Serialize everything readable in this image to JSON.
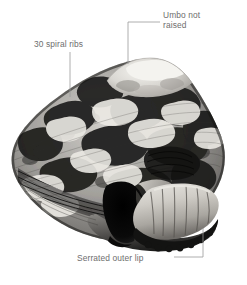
{
  "figure": {
    "background_color": "#ffffff",
    "label_color": "#6e6e6e",
    "leader_color": "#9a9a9a",
    "width": 247,
    "height": 285
  },
  "annotations": {
    "spiral_ribs": {
      "text": "30 spiral ribs",
      "leader": "vertical line down to shell flank"
    },
    "umbo": {
      "text": "Umbo not\nraised",
      "line1": "Umbo not",
      "line2": "raised",
      "leader": "elbow line left then down to shell apex"
    },
    "outer_lip": {
      "text": "Serrated outer lip",
      "leader": "elbow line right then up to shell lip"
    }
  },
  "image": {
    "alt": "Black and white photograph of a conical sea snail shell with mottled dark and light camouflage banding, spiral ribs on the body whorl, a dark aperture opening and a pale ribbed outer lip.",
    "tones": {
      "darkest": "#101010",
      "dark": "#3a3a3a",
      "mid": "#8d8d8d",
      "light": "#d2d2d2",
      "lightest": "#f2f1ee"
    }
  }
}
